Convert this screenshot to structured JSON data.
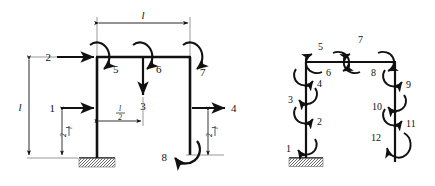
{
  "figure": {
    "background_color": "#ffffff",
    "line_color": "#111111",
    "panels": [
      {
        "id": "left-panel",
        "name": "applied-loads-frame",
        "description": "Portal-type frame with applied concentrated loads and moments",
        "dimensions": [
          {
            "name": "top-span",
            "label": "l",
            "orientation": "horizontal",
            "position": "top"
          },
          {
            "name": "left-height",
            "label": "l",
            "orientation": "vertical",
            "position": "left"
          },
          {
            "name": "mid-offset",
            "label": "l/2",
            "numerator": "l",
            "denominator": "2",
            "orientation": "horizontal",
            "position": "mid-beam"
          },
          {
            "name": "lower-left-height",
            "label": "l/2",
            "numerator": "l",
            "denominator": "2",
            "orientation": "vertical",
            "position": "lower-left"
          },
          {
            "name": "lower-right-height",
            "label": "l/2",
            "numerator": "l",
            "denominator": "2",
            "orientation": "vertical",
            "position": "lower-right"
          }
        ],
        "loads": [
          {
            "id": 1,
            "label": "1",
            "type": "force",
            "direction": "right",
            "location": "left-column-mid"
          },
          {
            "id": 2,
            "label": "2",
            "type": "force",
            "direction": "right",
            "location": "left-column-top"
          },
          {
            "id": 3,
            "label": "3",
            "type": "force",
            "direction": "down",
            "location": "beam-midspan"
          },
          {
            "id": 4,
            "label": "4",
            "type": "force",
            "direction": "right",
            "location": "right-column-mid"
          },
          {
            "id": 5,
            "label": "5",
            "type": "moment",
            "sense": "clockwise",
            "location": "left-joint"
          },
          {
            "id": 6,
            "label": "6",
            "type": "moment",
            "sense": "clockwise",
            "location": "beam-midspan"
          },
          {
            "id": 7,
            "label": "7",
            "type": "moment",
            "sense": "clockwise",
            "location": "right-joint"
          },
          {
            "id": 8,
            "label": "8",
            "type": "moment",
            "sense": "counterclockwise",
            "location": "right-column-base"
          }
        ],
        "supports": [
          {
            "name": "fixed-support",
            "type": "fixed",
            "location": "left-column-base"
          }
        ]
      },
      {
        "id": "right-panel",
        "name": "member-end-moments-frame",
        "description": "Same frame showing twelve numbered member-end moment degrees of freedom",
        "loads": [
          {
            "id": 1,
            "label": "1",
            "type": "moment",
            "sense": "counterclockwise",
            "location": "left-column-base"
          },
          {
            "id": 2,
            "label": "2",
            "type": "moment",
            "sense": "clockwise",
            "location": "left-column-upper"
          },
          {
            "id": 3,
            "label": "3",
            "type": "moment",
            "sense": "counterclockwise",
            "location": "left-column-upper"
          },
          {
            "id": 4,
            "label": "4",
            "type": "moment",
            "sense": "clockwise",
            "location": "left-column-top"
          },
          {
            "id": 5,
            "label": "5",
            "type": "moment",
            "sense": "counterclockwise",
            "location": "beam-left-end"
          },
          {
            "id": 6,
            "label": "6",
            "type": "moment",
            "sense": "clockwise",
            "location": "beam-left-inner"
          },
          {
            "id": 7,
            "label": "7",
            "type": "moment",
            "sense": "counterclockwise",
            "location": "beam-right-inner"
          },
          {
            "id": 8,
            "label": "8",
            "type": "moment",
            "sense": "clockwise",
            "location": "beam-right-end"
          },
          {
            "id": 9,
            "label": "9",
            "type": "moment",
            "sense": "clockwise",
            "location": "right-column-top"
          },
          {
            "id": 10,
            "label": "10",
            "type": "moment",
            "sense": "counterclockwise",
            "location": "right-column-upper"
          },
          {
            "id": 11,
            "label": "11",
            "type": "moment",
            "sense": "clockwise",
            "location": "right-column-upper"
          },
          {
            "id": 12,
            "label": "12",
            "type": "moment",
            "sense": "counterclockwise",
            "location": "right-column-lower"
          }
        ],
        "supports": [
          {
            "name": "fixed-support",
            "type": "fixed",
            "location": "left-column-base"
          }
        ]
      }
    ]
  }
}
